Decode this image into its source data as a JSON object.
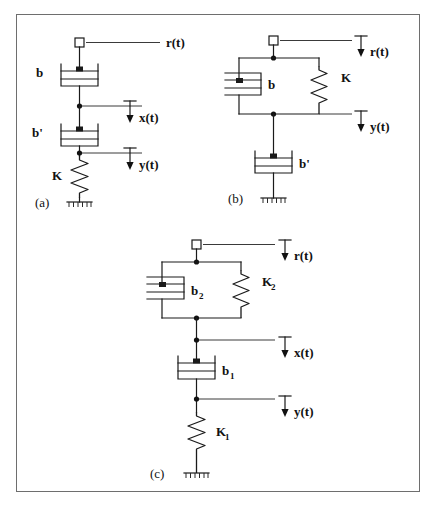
{
  "figure": {
    "type": "mechanical-system-schematic",
    "background_color": "#ffffff",
    "line_color": "#1a1a1a",
    "border_color": "#6e6e6e",
    "panels": [
      {
        "id": "a",
        "caption": "(a)",
        "description": "Series chain: input node r(t) at top connects to damper b, then node x(t), then damper b', then node y(t), then spring K to ground.",
        "signals": [
          "r(t)",
          "x(t)",
          "y(t)"
        ],
        "elements": [
          "b",
          "b'",
          "K"
        ],
        "labels": {
          "r": "r(t)",
          "x": "x(t)",
          "y": "y(t)",
          "damper_top": "b",
          "damper_bottom": "b'",
          "spring": "K"
        }
      },
      {
        "id": "b",
        "caption": "(b)",
        "description": "Input node r(t) connects to a parallel combination of damper b and spring K; the parallel pair terminates at node y(t), which connects through damper b' to ground.",
        "signals": [
          "r(t)",
          "y(t)"
        ],
        "elements": [
          "b",
          "K",
          "b'"
        ],
        "labels": {
          "r": "r(t)",
          "y": "y(t)",
          "damper_parallel": "b",
          "spring_parallel": "K",
          "damper_ground": "b'"
        }
      },
      {
        "id": "c",
        "caption": "(c)",
        "description": "Input node r(t) connects to a parallel combination of damper b2 and spring K2; this joins node x(t), then damper b1, then node y(t), then spring K1 to ground.",
        "signals": [
          "r(t)",
          "x(t)",
          "y(t)"
        ],
        "elements": [
          "b2",
          "K2",
          "b1",
          "K1"
        ],
        "labels": {
          "r": "r(t)",
          "x": "x(t)",
          "y": "y(t)",
          "damper_parallel": "b",
          "damper_parallel_sub": "2",
          "spring_parallel": "K",
          "spring_parallel_sub": "2",
          "damper_series": "b",
          "damper_series_sub": "1",
          "spring_ground": "K",
          "spring_ground_sub": "1"
        }
      }
    ]
  }
}
